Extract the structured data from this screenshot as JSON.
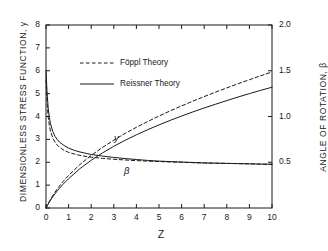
{
  "chart_data": {
    "type": "line",
    "title": "",
    "xlabel": "Z",
    "ylabel": "DIMENSIONLESS STRESS FUNCTION, y",
    "ylabel_right": "ANGLE OF ROTATION, β",
    "xlim": [
      0,
      10
    ],
    "ylim": [
      0,
      8
    ],
    "ylim_right": [
      0,
      2.0
    ],
    "grid": false,
    "legend_position": "upper-left-inside",
    "xticks": [
      "0",
      "1",
      "2",
      "3",
      "4",
      "5",
      "6",
      "7",
      "8",
      "9",
      "10"
    ],
    "yticks_left": [
      "0",
      "1",
      "2",
      "3",
      "4",
      "5",
      "6",
      "7",
      "8"
    ],
    "yticks_right": [
      "0.5",
      "1.0",
      "1.5",
      "2.0"
    ],
    "annotations": [
      {
        "text": "y",
        "x": 2.9,
        "y": 2.95
      },
      {
        "text": "β",
        "x": 3.5,
        "y": 1.55
      }
    ],
    "legend": [
      {
        "label": "Föppl Theory",
        "style": "dashed"
      },
      {
        "label": "Reissner Theory",
        "style": "solid"
      }
    ],
    "series": [
      {
        "name": "y — Reissner Theory",
        "axis": "left",
        "style": "solid",
        "x": [
          0.0,
          0.05,
          0.1,
          0.15,
          0.2,
          0.3,
          0.4,
          0.5,
          0.6,
          0.8,
          1.0,
          1.25,
          1.5,
          2.0,
          2.5,
          3.0,
          3.5,
          4.0,
          4.5,
          5.0,
          5.5,
          6.0,
          6.5,
          7.0,
          7.5,
          8.0,
          8.5,
          9.0,
          9.5,
          10.0
        ],
        "y": [
          6.0,
          5.0,
          4.35,
          3.95,
          3.68,
          3.34,
          3.13,
          2.99,
          2.88,
          2.73,
          2.62,
          2.52,
          2.45,
          2.34,
          2.27,
          2.21,
          2.16,
          2.12,
          2.08,
          2.05,
          2.03,
          2.01,
          1.99,
          1.97,
          1.96,
          1.95,
          1.94,
          1.93,
          1.92,
          1.91
        ]
      },
      {
        "name": "y — Föppl Theory",
        "axis": "left",
        "style": "dashed",
        "x": [
          0.0,
          0.05,
          0.1,
          0.15,
          0.2,
          0.3,
          0.4,
          0.5,
          0.6,
          0.8,
          1.0,
          1.25,
          1.5,
          2.0,
          2.5,
          3.0,
          3.5,
          4.0,
          4.5,
          5.0,
          5.5,
          6.0,
          6.5,
          7.0,
          7.5,
          8.0,
          8.5,
          9.0,
          9.5,
          10.0
        ],
        "y": [
          5.6,
          4.55,
          3.95,
          3.6,
          3.36,
          3.06,
          2.88,
          2.75,
          2.65,
          2.52,
          2.43,
          2.36,
          2.3,
          2.22,
          2.17,
          2.13,
          2.1,
          2.07,
          2.05,
          2.03,
          2.01,
          2.0,
          1.98,
          1.97,
          1.96,
          1.95,
          1.94,
          1.93,
          1.92,
          1.91
        ]
      },
      {
        "name": "β — Reissner Theory",
        "axis": "right",
        "style": "solid",
        "x": [
          0.0,
          0.1,
          0.2,
          0.3,
          0.5,
          0.75,
          1.0,
          1.5,
          2.0,
          2.5,
          3.0,
          3.5,
          4.0,
          4.5,
          5.0,
          5.5,
          6.0,
          6.5,
          7.0,
          7.5,
          8.0,
          8.5,
          9.0,
          9.5,
          10.0
        ],
        "y": [
          0.0,
          0.045,
          0.085,
          0.122,
          0.188,
          0.258,
          0.32,
          0.43,
          0.522,
          0.602,
          0.675,
          0.74,
          0.8,
          0.856,
          0.908,
          0.958,
          1.005,
          1.05,
          1.093,
          1.134,
          1.174,
          1.213,
          1.25,
          1.286,
          1.32
        ]
      },
      {
        "name": "β — Föppl Theory",
        "axis": "right",
        "style": "dashed",
        "x": [
          0.0,
          0.1,
          0.2,
          0.3,
          0.5,
          0.75,
          1.0,
          1.5,
          2.0,
          2.5,
          3.0,
          3.5,
          4.0,
          4.5,
          5.0,
          5.5,
          6.0,
          6.5,
          7.0,
          7.5,
          8.0,
          8.5,
          9.0,
          9.5,
          10.0
        ],
        "y": [
          0.0,
          0.05,
          0.095,
          0.137,
          0.21,
          0.288,
          0.356,
          0.475,
          0.575,
          0.662,
          0.742,
          0.815,
          0.882,
          0.945,
          1.005,
          1.062,
          1.116,
          1.168,
          1.218,
          1.266,
          1.313,
          1.358,
          1.402,
          1.445,
          1.487
        ]
      }
    ]
  },
  "axes": {
    "x_title": "Z",
    "y_title_left": "DIMENSIONLESS STRESS FUNCTION, y",
    "y_title_right": "ANGLE OF ROTATION, β"
  },
  "legend": {
    "foppl": "Föppl Theory",
    "reissner": "Reissner Theory"
  },
  "annotations": {
    "y_label": "y",
    "beta_label": "β"
  },
  "colors": {
    "axis": "#1a1a1a",
    "curve": "#1a1a1a",
    "background": "#ffffff"
  }
}
